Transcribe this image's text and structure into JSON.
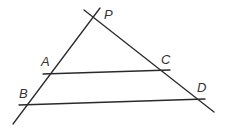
{
  "diagram": {
    "type": "geometry",
    "points": [
      {
        "id": "P",
        "label": "P"
      },
      {
        "id": "A",
        "label": "A"
      },
      {
        "id": "B",
        "label": "B"
      },
      {
        "id": "C",
        "label": "C"
      },
      {
        "id": "D",
        "label": "D"
      }
    ],
    "lines": [
      {
        "id": "PB",
        "through": [
          "P",
          "A",
          "B"
        ]
      },
      {
        "id": "PD",
        "through": [
          "P",
          "C",
          "D"
        ]
      },
      {
        "id": "AC",
        "through": [
          "A",
          "C"
        ]
      },
      {
        "id": "BD",
        "through": [
          "B",
          "D"
        ]
      }
    ],
    "colors": {
      "stroke": "#2a2a2a",
      "label": "#333333",
      "background": "#ffffff"
    }
  }
}
